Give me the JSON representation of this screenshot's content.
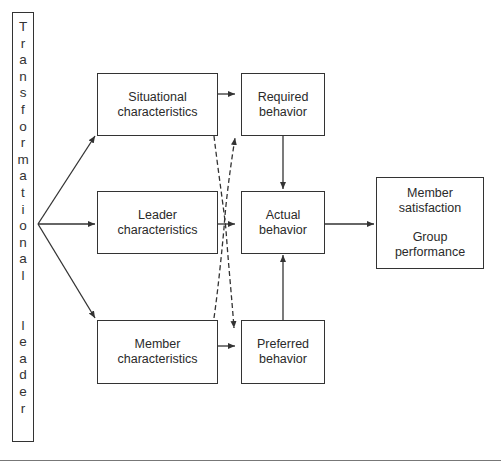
{
  "diagram": {
    "leader_bar": {
      "word1": [
        "T",
        "r",
        "a",
        "n",
        "s",
        "f",
        "o",
        "r",
        "m",
        "a",
        "t",
        "i",
        "o",
        "n",
        "a",
        "l"
      ],
      "word2": [
        "l",
        "e",
        "a",
        "d",
        "e",
        "r"
      ],
      "full_text": "Transformational leader"
    },
    "antecedents": {
      "situational": {
        "line1": "Situational",
        "line2": "characteristics"
      },
      "leader": {
        "line1": "Leader",
        "line2": "characteristics"
      },
      "member": {
        "line1": "Member",
        "line2": "characteristics"
      }
    },
    "behaviors": {
      "required": {
        "line1": "Required",
        "line2": "behavior"
      },
      "actual": {
        "line1": "Actual",
        "line2": "behavior"
      },
      "preferred": {
        "line1": "Preferred",
        "line2": "behavior"
      }
    },
    "outcomes": {
      "line1": "Member",
      "line2": "satisfaction",
      "line3": "Group",
      "line4": "performance"
    },
    "edges": [
      {
        "from": "Transformational leader",
        "to": "Situational characteristics",
        "style": "solid"
      },
      {
        "from": "Transformational leader",
        "to": "Leader characteristics",
        "style": "solid"
      },
      {
        "from": "Transformational leader",
        "to": "Member characteristics",
        "style": "solid"
      },
      {
        "from": "Situational characteristics",
        "to": "Required behavior",
        "style": "solid"
      },
      {
        "from": "Leader characteristics",
        "to": "Actual behavior",
        "style": "solid"
      },
      {
        "from": "Member characteristics",
        "to": "Preferred behavior",
        "style": "solid"
      },
      {
        "from": "Situational characteristics",
        "to": "Preferred behavior",
        "style": "dashed"
      },
      {
        "from": "Member characteristics",
        "to": "Required behavior",
        "style": "dashed"
      },
      {
        "from": "Required behavior",
        "to": "Actual behavior",
        "style": "solid"
      },
      {
        "from": "Preferred behavior",
        "to": "Actual behavior",
        "style": "solid"
      },
      {
        "from": "Actual behavior",
        "to": "Member satisfaction / Group performance",
        "style": "solid"
      }
    ],
    "colors": {
      "stroke": "#333333",
      "background": "#ffffff"
    }
  }
}
